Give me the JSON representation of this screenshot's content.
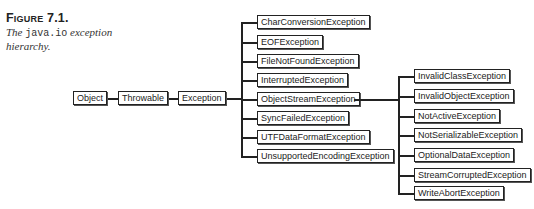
{
  "caption": {
    "figure_label": "Figure 7.1.",
    "text_prefix": "The ",
    "text_code": "java.io",
    "text_suffix": " exception hierarchy."
  },
  "diagram": {
    "type": "class-hierarchy",
    "chain": [
      "Object",
      "Throwable",
      "Exception"
    ],
    "exception_subclasses": [
      "CharConversionException",
      "EOFException",
      "FileNotFoundException",
      "InterruptedException",
      "ObjectStreamException",
      "SyncFailedException",
      "UTFDataFormatException",
      "UnsupportedEncodingException"
    ],
    "objectstream_subclasses": [
      "InvalidClassException",
      "InvalidObjectException",
      "NotActiveException",
      "NotSerializableException",
      "OptionalDataException",
      "StreamCorruptedException",
      "WriteAbortException"
    ],
    "line_color": "#222222",
    "box_border_color": "#222222"
  }
}
